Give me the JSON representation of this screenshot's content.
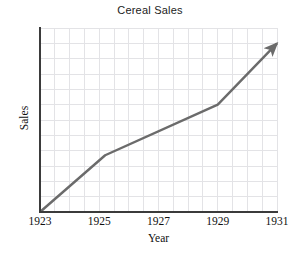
{
  "chart_data": {
    "type": "line",
    "title": "Cereal Sales",
    "xlabel": "Year",
    "ylabel": "Sales",
    "grid": true,
    "legend": "none",
    "xlim": [
      1923,
      1931
    ],
    "ylim": [
      0,
      12
    ],
    "x_tick_labels": [
      "1923",
      "1925",
      "1927",
      "1929",
      "1931"
    ],
    "x_tick_values": [
      1923,
      1925,
      1927,
      1929,
      1931
    ],
    "y_tick_labels": [],
    "grid_columns": 16,
    "grid_rows": 12,
    "series": [
      {
        "name": "Cereal Sales",
        "color": "#6b6b6b",
        "arrow_end": true,
        "x": [
          1923,
          1925.2,
          1929.0,
          1931
        ],
        "y": [
          0,
          3.7,
          7.0,
          11.0
        ],
        "points": [
          {
            "x": 1923,
            "y": 0,
            "note": "origin"
          },
          {
            "x": 1925.2,
            "y": 3.7,
            "note": "first bend"
          },
          {
            "x": 1929.0,
            "y": 7.0,
            "note": "second bend"
          },
          {
            "x": 1931,
            "y": 11.0,
            "note": "arrow tip"
          }
        ]
      }
    ],
    "annotations": []
  },
  "colors": {
    "background": "#ffffff",
    "grid_line": "#e3e3e6",
    "axis_line": "#3b3b3b",
    "series_line": "#6b6b6b",
    "text": "#101010",
    "title_text": "#222222"
  },
  "geometry": {
    "plot_left": 40,
    "plot_top": 28,
    "plot_width": 237,
    "plot_height": 184
  }
}
